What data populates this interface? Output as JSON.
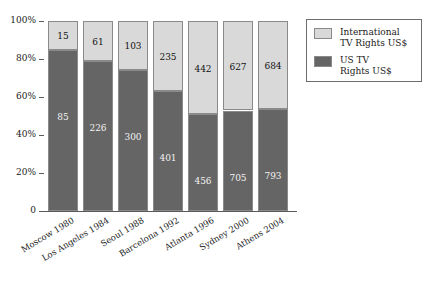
{
  "chart_data": {
    "type": "bar",
    "subtype": "stacked-100-percent",
    "title": "",
    "xlabel": "",
    "ylabel": "",
    "ylim": [
      0,
      100
    ],
    "grid": false,
    "legend_position": "right-top",
    "categories": [
      "Moscow 1980",
      "Los Angeles 1984",
      "Seoul 1988",
      "Barcelona 1992",
      "Atlanta 1996",
      "Sydney 2000",
      "Athens 2004"
    ],
    "series": [
      {
        "name": "US TV\nRights US$",
        "color": "#656565",
        "values": [
          85,
          226,
          300,
          401,
          456,
          705,
          793
        ],
        "percentages": [
          85.0,
          78.7,
          74.4,
          63.1,
          50.8,
          52.9,
          53.7
        ]
      },
      {
        "name": "International\nTV Rights US$",
        "color": "#d9d9d9",
        "values": [
          15,
          61,
          103,
          235,
          442,
          627,
          684
        ],
        "percentages": [
          15.0,
          21.3,
          25.6,
          36.9,
          49.2,
          47.1,
          46.3
        ]
      }
    ],
    "yticks": [
      {
        "value": 100,
        "label": "100%"
      },
      {
        "value": 80,
        "label": "80%"
      },
      {
        "value": 60,
        "label": "60%"
      },
      {
        "value": 40,
        "label": "40%"
      },
      {
        "value": 20,
        "label": "20%"
      },
      {
        "value": 0,
        "label": "0"
      }
    ]
  },
  "legend": {
    "entries": [
      {
        "label": "International\nTV Rights US$",
        "color": "#d9d9d9",
        "swatch_name": "legend-swatch-international"
      },
      {
        "label": "US TV\nRights US$",
        "color": "#656565",
        "swatch_name": "legend-swatch-us"
      }
    ]
  },
  "colors": {
    "us_tv": "#656565",
    "international_tv": "#d9d9d9",
    "axis": "#5a5a5a",
    "text": "#1a1a1a",
    "background": "#ffffff"
  }
}
